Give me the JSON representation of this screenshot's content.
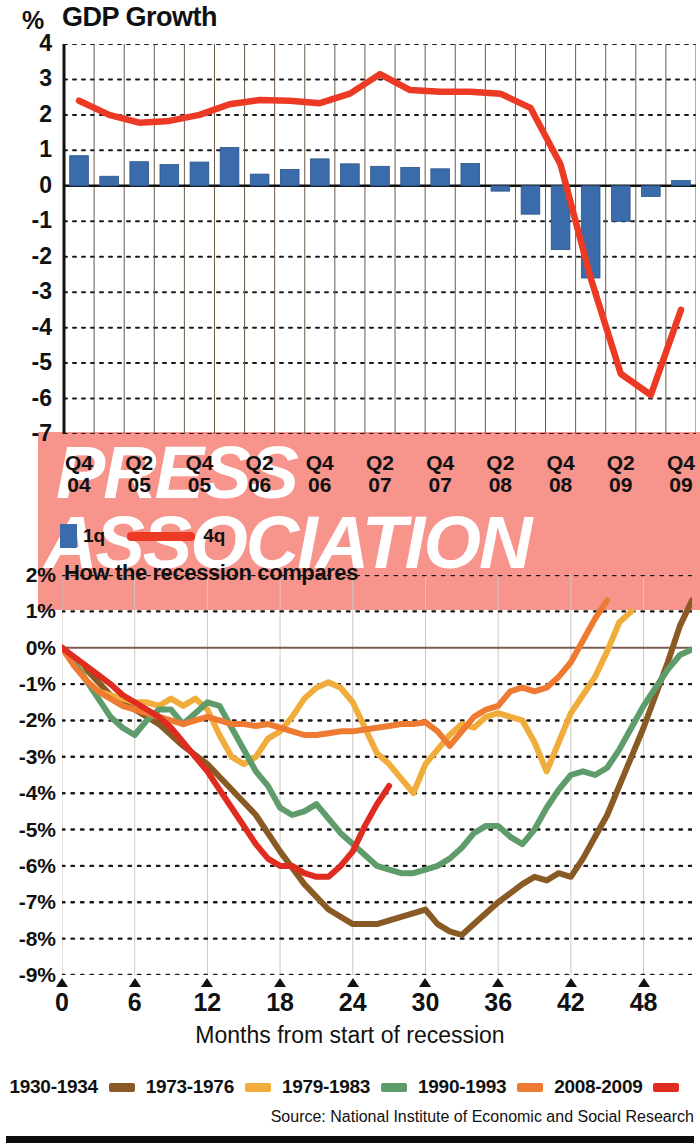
{
  "top_chart": {
    "unit": "%",
    "title": "GDP Growth",
    "y_labels": [
      "4",
      "3",
      "2",
      "1",
      "0",
      "-1",
      "-2",
      "-3",
      "-4",
      "-5",
      "-6",
      "-7"
    ],
    "x_labels": [
      {
        "q": "Q4",
        "y": "04"
      },
      {
        "q": "Q2",
        "y": "05"
      },
      {
        "q": "Q4",
        "y": "05"
      },
      {
        "q": "Q2",
        "y": "06"
      },
      {
        "q": "Q4",
        "y": "06"
      },
      {
        "q": "Q2",
        "y": "07"
      },
      {
        "q": "Q4",
        "y": "07"
      },
      {
        "q": "Q2",
        "y": "08"
      },
      {
        "q": "Q4",
        "y": "08"
      },
      {
        "q": "Q2",
        "y": "09"
      },
      {
        "q": "Q4",
        "y": "09"
      }
    ],
    "legend": {
      "bar_label": "1q",
      "line_label": "4q",
      "bar_color": "#3a6cab",
      "line_color": "#ec3a25"
    }
  },
  "bottom_chart": {
    "title": "How the recession compares",
    "y_labels": [
      "2%",
      "1%",
      "0%",
      "-1%",
      "-2%",
      "-3%",
      "-4%",
      "-5%",
      "-6%",
      "-7%",
      "-8%",
      "-9%"
    ],
    "x_labels": [
      "0",
      "6",
      "12",
      "18",
      "24",
      "30",
      "36",
      "42",
      "48"
    ],
    "xlabel": "Months from start of recession",
    "legend": [
      {
        "label": "1930-1934",
        "color": "#8a5a25"
      },
      {
        "label": "1973-1976",
        "color": "#f0ad3c"
      },
      {
        "label": "1979-1983",
        "color": "#5e9c6b"
      },
      {
        "label": "1990-1993",
        "color": "#ef7b32"
      },
      {
        "label": "2008-2009",
        "color": "#e02b20"
      }
    ]
  },
  "watermark": {
    "line1": "PRESS",
    "line2": "ASSOCIATION",
    "color": "#f7948c"
  },
  "source": "Source: National Institute of Economic and Social Research",
  "chart_data": [
    {
      "type": "bar",
      "id": "gdp-growth",
      "title": "GDP Growth",
      "xlabel": "",
      "ylabel": "%",
      "ylim": [
        -7,
        4
      ],
      "grid": true,
      "legend_position": "below-axis",
      "categories": [
        "Q4 04",
        "Q1 05",
        "Q2 05",
        "Q3 05",
        "Q4 05",
        "Q1 06",
        "Q2 06",
        "Q3 06",
        "Q4 06",
        "Q1 07",
        "Q2 07",
        "Q3 07",
        "Q4 07",
        "Q1 08",
        "Q2 08",
        "Q3 08",
        "Q4 08",
        "Q1 09",
        "Q2 09",
        "Q3 09",
        "Q4 09"
      ],
      "series": [
        {
          "name": "1q",
          "type": "bar",
          "color": "#3a6cab",
          "values": [
            0.85,
            0.27,
            0.68,
            0.6,
            0.67,
            1.08,
            0.33,
            0.46,
            0.76,
            0.62,
            0.55,
            0.52,
            0.48,
            0.63,
            -0.15,
            -0.8,
            -1.8,
            -2.6,
            -1.0,
            -0.3,
            0.15
          ]
        },
        {
          "name": "4q",
          "type": "line",
          "color": "#ec3a25",
          "values": [
            2.4,
            2.0,
            1.78,
            1.83,
            2.0,
            2.3,
            2.42,
            2.4,
            2.33,
            2.6,
            3.15,
            2.7,
            2.65,
            2.65,
            2.6,
            2.2,
            0.6,
            -2.6,
            -5.3,
            -5.9,
            -3.5
          ]
        }
      ]
    },
    {
      "type": "line",
      "id": "recession-comparison",
      "title": "How the recession compares",
      "xlabel": "Months from start of recession",
      "ylabel": "%",
      "xlim": [
        0,
        52
      ],
      "ylim": [
        -9,
        2
      ],
      "grid": true,
      "x_ticks": [
        0,
        6,
        12,
        18,
        24,
        30,
        36,
        42,
        48
      ],
      "legend_position": "bottom",
      "series": [
        {
          "name": "1930-1934",
          "color": "#8a5a25",
          "points": [
            [
              0,
              0
            ],
            [
              2,
              -0.6
            ],
            [
              4,
              -1.3
            ],
            [
              6,
              -1.7
            ],
            [
              8,
              -2.1
            ],
            [
              10,
              -2.7
            ],
            [
              12,
              -3.2
            ],
            [
              14,
              -3.9
            ],
            [
              16,
              -4.6
            ],
            [
              18,
              -5.6
            ],
            [
              20,
              -6.5
            ],
            [
              22,
              -7.2
            ],
            [
              24,
              -7.6
            ],
            [
              26,
              -7.6
            ],
            [
              28,
              -7.4
            ],
            [
              30,
              -7.2
            ],
            [
              31,
              -7.6
            ],
            [
              32,
              -7.8
            ],
            [
              33,
              -7.9
            ],
            [
              34,
              -7.6
            ],
            [
              36,
              -7.0
            ],
            [
              38,
              -6.5
            ],
            [
              39,
              -6.3
            ],
            [
              40,
              -6.4
            ],
            [
              41,
              -6.2
            ],
            [
              42,
              -6.3
            ],
            [
              43,
              -5.8
            ],
            [
              44,
              -5.2
            ],
            [
              45,
              -4.6
            ],
            [
              46,
              -3.8
            ],
            [
              47,
              -3.0
            ],
            [
              48,
              -2.2
            ],
            [
              49,
              -1.3
            ],
            [
              50,
              -0.4
            ],
            [
              51,
              0.6
            ],
            [
              52,
              1.3
            ]
          ]
        },
        {
          "name": "1973-1976",
          "color": "#f0ad3c",
          "points": [
            [
              0,
              0
            ],
            [
              1,
              -0.3
            ],
            [
              2,
              -0.9
            ],
            [
              3,
              -1.2
            ],
            [
              4,
              -1.3
            ],
            [
              5,
              -1.4
            ],
            [
              6,
              -1.5
            ],
            [
              7,
              -1.5
            ],
            [
              8,
              -1.6
            ],
            [
              9,
              -1.4
            ],
            [
              10,
              -1.6
            ],
            [
              11,
              -1.4
            ],
            [
              12,
              -1.7
            ],
            [
              13,
              -2.4
            ],
            [
              14,
              -3.0
            ],
            [
              15,
              -3.2
            ],
            [
              16,
              -3.0
            ],
            [
              17,
              -2.5
            ],
            [
              18,
              -2.3
            ],
            [
              19,
              -1.9
            ],
            [
              20,
              -1.4
            ],
            [
              21,
              -1.1
            ],
            [
              22,
              -0.95
            ],
            [
              23,
              -1.1
            ],
            [
              24,
              -1.5
            ],
            [
              25,
              -2.2
            ],
            [
              26,
              -2.9
            ],
            [
              27,
              -3.2
            ],
            [
              28,
              -3.6
            ],
            [
              29,
              -4.0
            ],
            [
              30,
              -3.2
            ],
            [
              31,
              -2.8
            ],
            [
              32,
              -2.4
            ],
            [
              33,
              -2.1
            ],
            [
              34,
              -2.2
            ],
            [
              35,
              -1.9
            ],
            [
              36,
              -1.8
            ],
            [
              37,
              -1.9
            ],
            [
              38,
              -2.0
            ],
            [
              39,
              -2.6
            ],
            [
              40,
              -3.4
            ],
            [
              41,
              -2.6
            ],
            [
              42,
              -1.8
            ],
            [
              43,
              -1.3
            ],
            [
              44,
              -0.8
            ],
            [
              45,
              -0.1
            ],
            [
              46,
              0.7
            ],
            [
              47,
              1.0
            ]
          ]
        },
        {
          "name": "1979-1983",
          "color": "#5e9c6b",
          "points": [
            [
              0,
              0
            ],
            [
              1,
              -0.4
            ],
            [
              2,
              -0.9
            ],
            [
              3,
              -1.4
            ],
            [
              4,
              -1.9
            ],
            [
              5,
              -2.2
            ],
            [
              6,
              -2.4
            ],
            [
              7,
              -2.0
            ],
            [
              8,
              -1.7
            ],
            [
              9,
              -1.7
            ],
            [
              10,
              -2.1
            ],
            [
              11,
              -1.8
            ],
            [
              12,
              -1.5
            ],
            [
              13,
              -1.6
            ],
            [
              14,
              -2.2
            ],
            [
              15,
              -2.8
            ],
            [
              16,
              -3.4
            ],
            [
              17,
              -3.8
            ],
            [
              18,
              -4.4
            ],
            [
              19,
              -4.6
            ],
            [
              20,
              -4.5
            ],
            [
              21,
              -4.3
            ],
            [
              22,
              -4.7
            ],
            [
              23,
              -5.1
            ],
            [
              24,
              -5.4
            ],
            [
              25,
              -5.7
            ],
            [
              26,
              -6.0
            ],
            [
              27,
              -6.1
            ],
            [
              28,
              -6.2
            ],
            [
              29,
              -6.2
            ],
            [
              30,
              -6.1
            ],
            [
              31,
              -6.0
            ],
            [
              32,
              -5.8
            ],
            [
              33,
              -5.5
            ],
            [
              34,
              -5.1
            ],
            [
              35,
              -4.9
            ],
            [
              36,
              -4.9
            ],
            [
              37,
              -5.2
            ],
            [
              38,
              -5.4
            ],
            [
              39,
              -5.0
            ],
            [
              40,
              -4.4
            ],
            [
              41,
              -3.9
            ],
            [
              42,
              -3.5
            ],
            [
              43,
              -3.4
            ],
            [
              44,
              -3.5
            ],
            [
              45,
              -3.3
            ],
            [
              46,
              -2.8
            ],
            [
              47,
              -2.2
            ],
            [
              48,
              -1.6
            ],
            [
              49,
              -1.1
            ],
            [
              50,
              -0.6
            ],
            [
              51,
              -0.2
            ],
            [
              52,
              -0.05
            ]
          ]
        },
        {
          "name": "1990-1993",
          "color": "#ef7b32",
          "points": [
            [
              0,
              0
            ],
            [
              1,
              -0.5
            ],
            [
              2,
              -0.9
            ],
            [
              3,
              -1.2
            ],
            [
              4,
              -1.4
            ],
            [
              5,
              -1.6
            ],
            [
              6,
              -1.7
            ],
            [
              7,
              -1.8
            ],
            [
              8,
              -1.9
            ],
            [
              9,
              -2.0
            ],
            [
              10,
              -2.1
            ],
            [
              11,
              -2.0
            ],
            [
              12,
              -1.9
            ],
            [
              13,
              -2.0
            ],
            [
              14,
              -2.1
            ],
            [
              15,
              -2.1
            ],
            [
              16,
              -2.15
            ],
            [
              17,
              -2.1
            ],
            [
              18,
              -2.2
            ],
            [
              19,
              -2.3
            ],
            [
              20,
              -2.4
            ],
            [
              21,
              -2.4
            ],
            [
              22,
              -2.35
            ],
            [
              23,
              -2.3
            ],
            [
              24,
              -2.3
            ],
            [
              25,
              -2.25
            ],
            [
              26,
              -2.2
            ],
            [
              27,
              -2.15
            ],
            [
              28,
              -2.1
            ],
            [
              29,
              -2.1
            ],
            [
              30,
              -2.05
            ],
            [
              31,
              -2.3
            ],
            [
              32,
              -2.7
            ],
            [
              33,
              -2.3
            ],
            [
              34,
              -1.9
            ],
            [
              35,
              -1.7
            ],
            [
              36,
              -1.6
            ],
            [
              37,
              -1.2
            ],
            [
              38,
              -1.1
            ],
            [
              39,
              -1.2
            ],
            [
              40,
              -1.1
            ],
            [
              41,
              -0.8
            ],
            [
              42,
              -0.4
            ],
            [
              43,
              0.2
            ],
            [
              44,
              0.8
            ],
            [
              45,
              1.3
            ]
          ]
        },
        {
          "name": "2008-2009",
          "color": "#e02b20",
          "points": [
            [
              0,
              0
            ],
            [
              1,
              -0.25
            ],
            [
              2,
              -0.5
            ],
            [
              3,
              -0.75
            ],
            [
              4,
              -1.0
            ],
            [
              5,
              -1.3
            ],
            [
              6,
              -1.5
            ],
            [
              7,
              -1.7
            ],
            [
              8,
              -1.9
            ],
            [
              9,
              -2.2
            ],
            [
              10,
              -2.6
            ],
            [
              11,
              -3.0
            ],
            [
              12,
              -3.4
            ],
            [
              13,
              -3.9
            ],
            [
              14,
              -4.4
            ],
            [
              15,
              -4.9
            ],
            [
              16,
              -5.4
            ],
            [
              17,
              -5.8
            ],
            [
              18,
              -6.0
            ],
            [
              19,
              -6.0
            ],
            [
              20,
              -6.2
            ],
            [
              21,
              -6.3
            ],
            [
              22,
              -6.3
            ],
            [
              23,
              -6.0
            ],
            [
              24,
              -5.6
            ],
            [
              25,
              -4.9
            ],
            [
              26,
              -4.3
            ],
            [
              27,
              -3.8
            ]
          ]
        }
      ]
    }
  ]
}
